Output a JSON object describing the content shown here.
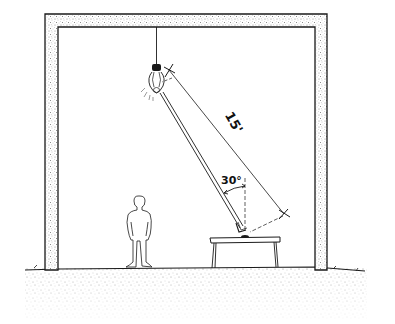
{
  "diagram": {
    "type": "architectural-section-sketch",
    "labels": {
      "distance": "15'",
      "angle": "30°"
    },
    "elements": [
      "wall-frame",
      "ceiling",
      "hanging-light-bulb",
      "light-ray",
      "distance-dimension-line",
      "vertical-reference-line",
      "angle-arc",
      "table",
      "human-figure",
      "ground"
    ],
    "colors": {
      "ink": "#1a1a1a",
      "stipple": "#8a8a8a",
      "background": "#ffffff"
    }
  }
}
